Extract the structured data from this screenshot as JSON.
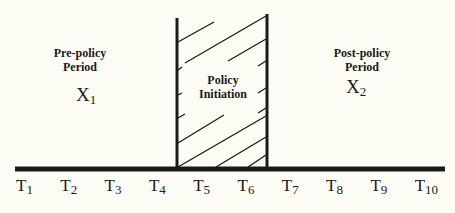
{
  "header_partial_text": "",
  "regions": {
    "pre": {
      "title_line1": "Pre-policy",
      "title_line2": "Period",
      "variable": "X",
      "variable_sub": "1"
    },
    "policy": {
      "title_line1": "Policy",
      "title_line2": "Initiation"
    },
    "post": {
      "title_line1": "Post-policy",
      "title_line2": "Period",
      "variable": "X",
      "variable_sub": "2"
    }
  },
  "timeline": {
    "ticks": [
      {
        "main": "T",
        "sub": "1"
      },
      {
        "main": "T",
        "sub": "2"
      },
      {
        "main": "T",
        "sub": "3"
      },
      {
        "main": "T",
        "sub": "4"
      },
      {
        "main": "T",
        "sub": "5"
      },
      {
        "main": "T",
        "sub": "6"
      },
      {
        "main": "T",
        "sub": "7"
      },
      {
        "main": "T",
        "sub": "8"
      },
      {
        "main": "T",
        "sub": "9"
      },
      {
        "main": "T",
        "sub": "10"
      }
    ],
    "policy_start_between": [
      "T4",
      "T5"
    ],
    "policy_end_between": [
      "T6",
      "T7"
    ]
  },
  "colors": {
    "ink": "#1a1a1a",
    "background": "#fdfdf5"
  }
}
